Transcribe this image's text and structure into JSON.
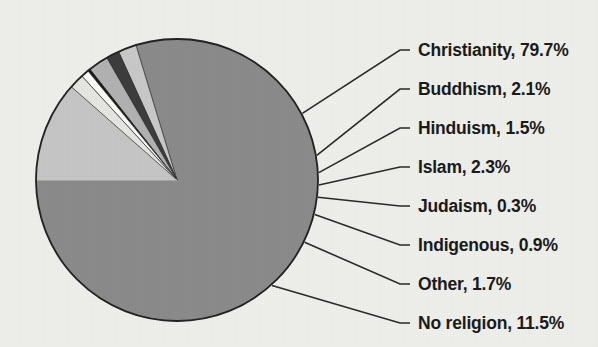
{
  "chart_data": {
    "type": "pie",
    "title": "",
    "subtitle": "",
    "xlabel": "",
    "ylabel": "",
    "legend_position": "right-callout-labels",
    "grid": false,
    "units": "percent",
    "total": 100.0,
    "start_angle_deg": 180,
    "direction": "counterclockwise",
    "categories": [
      "Christianity",
      "Buddhism",
      "Hinduism",
      "Islam",
      "Judaism",
      "Indigenous",
      "Other",
      "No religion"
    ],
    "values": [
      79.7,
      2.1,
      1.5,
      2.3,
      0.3,
      0.9,
      1.7,
      11.5
    ],
    "colors": [
      "#8b8b8b",
      "#c9c9c9",
      "#3d3d3d",
      "#b2b2b2",
      "#151515",
      "#fbfbf8",
      "#e6e6e2",
      "#c6c6c6"
    ],
    "labels": [
      "Christianity, 79.7%",
      "Buddhism, 2.1%",
      "Hinduism, 1.5%",
      "Islam, 2.3%",
      "Judaism, 0.3%",
      "Indigenous, 0.9%",
      "Other, 1.7%",
      "No religion, 11.5%"
    ]
  },
  "figure": {
    "background_color": "#efefeb",
    "outline_color": "#232323",
    "text_color": "#1b1b1b",
    "leader_color": "#2a2a2a",
    "center_x": 177,
    "center_y": 180,
    "radius": 141
  },
  "labels_layout": {
    "text_x": 418,
    "rows_y": [
      50,
      89,
      128,
      167,
      206,
      245,
      284,
      323
    ],
    "elbow_x": 400
  }
}
